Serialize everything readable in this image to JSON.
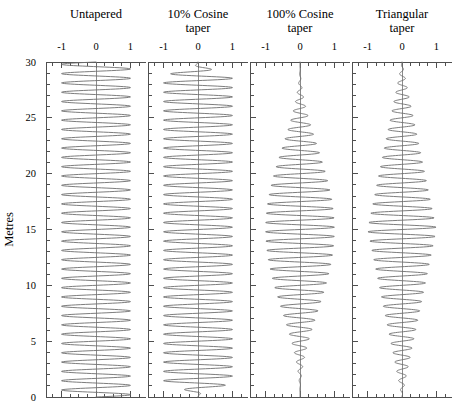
{
  "figure": {
    "y_axis_title": "Metres",
    "background_color": "#ffffff",
    "line_color": "#6e6e6e",
    "axis_color": "#4f4f4f"
  },
  "chart_data": {
    "type": "line",
    "title": "",
    "xlabel": "",
    "ylabel": "Metres",
    "ylim": [
      0,
      30
    ],
    "xlim": [
      -1.45,
      1.45
    ],
    "grid": false,
    "legend": "none",
    "orientation": "vertical",
    "y_ticks_major": [
      0,
      5,
      10,
      15,
      20,
      25,
      30
    ],
    "y_ticks_minor_step": 1,
    "x_ticks_major": [
      -1,
      0,
      1
    ],
    "x_tick_labels": [
      "-1",
      "0",
      "1"
    ],
    "x_ticks_minor_step": 0.25,
    "wave_cycles": 36,
    "samples": 1400,
    "panels": [
      {
        "title_line1": "Untapered",
        "title_line2": "",
        "taper": "none",
        "taper_fraction": 0
      },
      {
        "title_line1": "10% Cosine",
        "title_line2": "taper",
        "taper": "tukey",
        "taper_fraction": 0.1
      },
      {
        "title_line1": "100% Cosine",
        "title_line2": "taper",
        "taper": "tukey",
        "taper_fraction": 1.0
      },
      {
        "title_line1": "Triangular",
        "title_line2": "taper",
        "taper": "triangular",
        "taper_fraction": 1.0
      }
    ]
  }
}
